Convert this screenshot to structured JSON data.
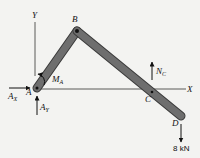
{
  "diagram": {
    "type": "free-body-diagram",
    "axes": {
      "x_label": "X",
      "y_label": "Y"
    },
    "points": {
      "A": "A",
      "B": "B",
      "C": "C",
      "D": "D"
    },
    "forces": {
      "Ax": {
        "main": "A",
        "sub": "X"
      },
      "Ay": {
        "main": "A",
        "sub": "Y"
      },
      "Ma": {
        "main": "M",
        "sub": "A"
      },
      "Nc": {
        "main": "N",
        "sub": "C"
      },
      "load": "8 kN"
    },
    "colors": {
      "member": "#6e6e6e",
      "member_edge": "#3a3a3a",
      "line": "#222222",
      "background": "#f3f3f1"
    }
  }
}
